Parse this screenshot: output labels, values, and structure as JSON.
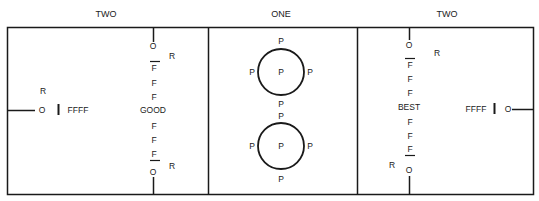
{
  "sections": [
    {
      "title": "TWO",
      "side_item": {
        "top_label": "R",
        "circle_label": "O",
        "bar_label": "FFFF"
      },
      "column": {
        "top_o": "O",
        "top_r": "R",
        "f_top": [
          "F",
          "F",
          "F"
        ],
        "center": "GOOD",
        "f_bottom": [
          "F",
          "F",
          "F"
        ],
        "bottom_o": "O",
        "bottom_r": "R"
      }
    },
    {
      "title": "ONE",
      "circles": [
        {
          "top": "P",
          "left": "P",
          "center": "P",
          "right": "P",
          "bottom": "P"
        },
        {
          "top": "P",
          "left": "P",
          "center": "P",
          "right": "P",
          "bottom": "P"
        }
      ]
    },
    {
      "title": "TWO",
      "side_item": {
        "circle_label": "O",
        "bar_label": "FFFF"
      },
      "column": {
        "top_o": "O",
        "top_r": "R",
        "f_top": [
          "F",
          "F",
          "F"
        ],
        "center": "BEST",
        "f_bottom": [
          "F",
          "F",
          "F"
        ],
        "bottom_o": "O",
        "bottom_r": "R"
      }
    }
  ]
}
